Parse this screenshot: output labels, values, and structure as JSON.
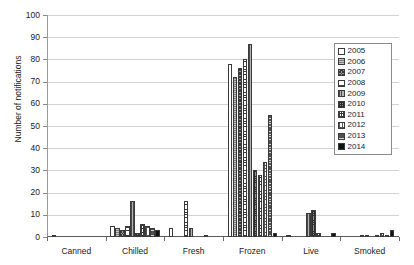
{
  "chart_data": {
    "type": "bar",
    "title": "",
    "xlabel": "",
    "ylabel": "Number of notifications",
    "ylim": [
      0,
      100
    ],
    "ytick_labels": [
      "100",
      "90",
      "80",
      "70",
      "60",
      "50",
      "40",
      "30",
      "20",
      "10",
      "0"
    ],
    "ytick_values": [
      100,
      90,
      80,
      70,
      60,
      50,
      40,
      30,
      20,
      10,
      0
    ],
    "grid": true,
    "legend_position": "right-top",
    "categories": [
      "Canned",
      "Chilled",
      "Fresh",
      "Frozen",
      "Live",
      "Smoked"
    ],
    "series": [
      {
        "name": "2005",
        "values": [
          1,
          5,
          4,
          78,
          1,
          0
        ]
      },
      {
        "name": "2006",
        "values": [
          0,
          4,
          0,
          72,
          0,
          0
        ]
      },
      {
        "name": "2007",
        "values": [
          0,
          3,
          0,
          76,
          0,
          0
        ]
      },
      {
        "name": "2008",
        "values": [
          0,
          5,
          16,
          80,
          0,
          1
        ]
      },
      {
        "name": "2009",
        "values": [
          0,
          16,
          4,
          87,
          11,
          1
        ]
      },
      {
        "name": "2010",
        "values": [
          0,
          2,
          0,
          30,
          12,
          0
        ]
      },
      {
        "name": "2011",
        "values": [
          0,
          6,
          0,
          28,
          2,
          1
        ]
      },
      {
        "name": "2012",
        "values": [
          0,
          5,
          1,
          34,
          0,
          2
        ]
      },
      {
        "name": "2013",
        "values": [
          0,
          4,
          0,
          55,
          0,
          1
        ]
      },
      {
        "name": "2014",
        "values": [
          0,
          3,
          0,
          2,
          2,
          3
        ]
      }
    ]
  },
  "legend": {
    "items": [
      {
        "label": "2005"
      },
      {
        "label": "2006"
      },
      {
        "label": "2007"
      },
      {
        "label": "2008"
      },
      {
        "label": "2009"
      },
      {
        "label": "2010"
      },
      {
        "label": "2011"
      },
      {
        "label": "2012"
      },
      {
        "label": "2013"
      },
      {
        "label": "2014"
      }
    ]
  }
}
